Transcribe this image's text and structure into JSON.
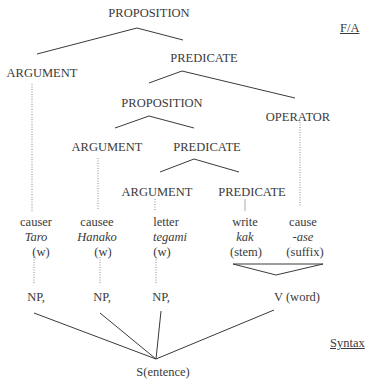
{
  "layers": {
    "fa_label": "F/A",
    "syntax_label": "Syntax"
  },
  "fa_tree": {
    "root": "PROPOSITION",
    "argument1": "ARGUMENT",
    "predicate1": "PREDICATE",
    "proposition2": "PROPOSITION",
    "operator": "OPERATOR",
    "argument2": "ARGUMENT",
    "predicate2": "PREDICATE",
    "argument3": "ARGUMENT",
    "predicate3": "PREDICATE"
  },
  "words": [
    {
      "gloss": "causer",
      "form": "Taro",
      "type": "(w)"
    },
    {
      "gloss": "causee",
      "form": "Hanako",
      "type": "(w)"
    },
    {
      "gloss": "letter",
      "form": "tegami",
      "type": "(w)"
    },
    {
      "gloss": "write",
      "form": "kak",
      "type": "(stem)"
    },
    {
      "gloss": "cause",
      "form": "-ase",
      "type": "(suffix)"
    }
  ],
  "syntax_tree": {
    "np1": "NP,",
    "np2": "NP,",
    "np3": "NP,",
    "verb": "V (word)",
    "sentence": "S(entence)"
  },
  "colors": {
    "text": "#3a3a3a",
    "line": "#3a3a3a",
    "dotted": "#8a8a8a",
    "background": "#ffffff"
  }
}
